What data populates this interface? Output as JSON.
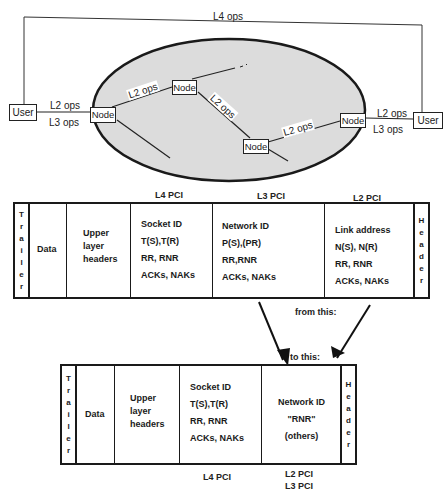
{
  "network": {
    "top_label": "L4 ops",
    "user_left": "User",
    "user_right": "User",
    "node_label": "Node",
    "left_link_top": "L2 ops",
    "left_link_bottom": "L3 ops",
    "right_link_top": "L2 ops",
    "right_link_bottom": "L3 ops",
    "internal_links": [
      "L2 ops",
      "L2 ops",
      "L2 ops"
    ],
    "cloud_fill": "#dcdcdc"
  },
  "frame_top": {
    "headings": {
      "l4": "L4 PCI",
      "l3": "L3 PCI",
      "l2": "L2 PCI"
    },
    "trailer": [
      "T",
      "r",
      "a",
      "i",
      "l",
      "e",
      "r"
    ],
    "header": [
      "H",
      "e",
      "a",
      "d",
      "e",
      "r"
    ],
    "data": "Data",
    "upper": [
      "Upper",
      "layer",
      "headers"
    ],
    "l4_lines": [
      "Socket ID",
      "T(S),T(R)",
      "RR, RNR",
      "ACKs, NAKs"
    ],
    "l3_lines": [
      "Network ID",
      "P(S),(PR)",
      "RR,RNR",
      "ACKs, NAKs"
    ],
    "l2_lines": [
      "Link address",
      "N(S), N(R)",
      "RR, RNR",
      "ACKs, NAKs"
    ]
  },
  "transition": {
    "from_label": "from this:",
    "to_label": "to this:"
  },
  "frame_bottom": {
    "trailer": [
      "T",
      "r",
      "a",
      "i",
      "l",
      "e",
      "r"
    ],
    "header": [
      "H",
      "e",
      "a",
      "d",
      "e",
      "r"
    ],
    "data": "Data",
    "upper": [
      "Upper",
      "layer",
      "headers"
    ],
    "l4_lines": [
      "Socket ID",
      "T(S),T(R)",
      "RR, RNR",
      "ACKs, NAKs"
    ],
    "net_lines": [
      "Network ID",
      "\"RNR\"",
      "(others)"
    ],
    "footer_l4": "L4 PCI",
    "footer_l2": "L2 PCI",
    "footer_l3": "L3 PCI"
  }
}
